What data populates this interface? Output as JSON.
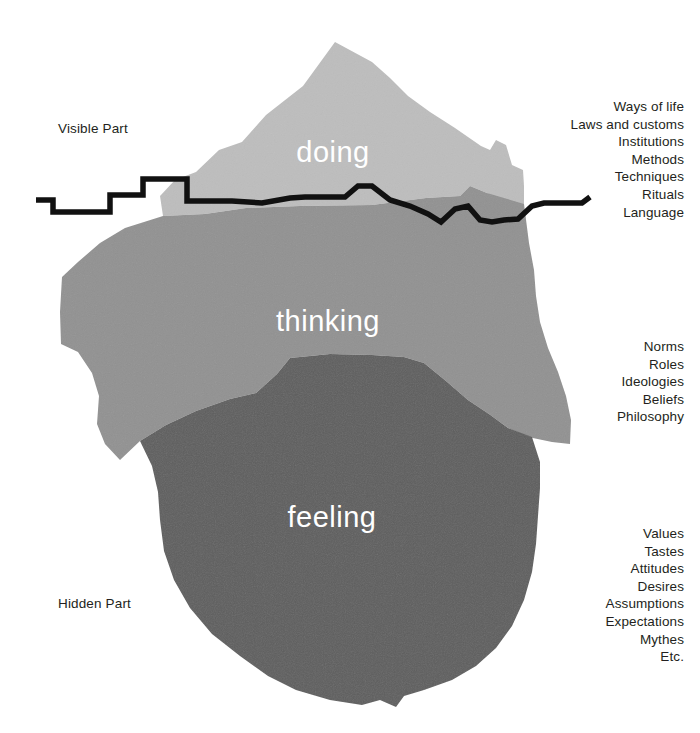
{
  "diagram": {
    "background_color": "#ffffff",
    "text_color": "#231f20",
    "waterline_color": "#111111"
  },
  "side_labels": {
    "visible": "Visible Part",
    "hidden": "Hidden Part"
  },
  "layers": {
    "doing": {
      "label": "doing",
      "color": "#bdbdbd",
      "label_color": "#ffffff",
      "terms": [
        "Ways of life",
        "Laws and  customs",
        "Institutions",
        "Methods",
        "Techniques",
        "Rituals",
        "Language"
      ]
    },
    "thinking": {
      "label": "thinking",
      "color": "#919191",
      "label_color": "#ffffff",
      "terms": [
        "Norms",
        "Roles",
        "Ideologies",
        "Beliefs",
        "Philosophy"
      ]
    },
    "feeling": {
      "label": "feeling",
      "color": "#5e5e5e",
      "label_color": "#ffffff",
      "terms": [
        "Values",
        "Tastes",
        "Attitudes",
        "Desires",
        "Assumptions",
        "Expectations",
        "Mythes",
        "Etc."
      ]
    }
  }
}
